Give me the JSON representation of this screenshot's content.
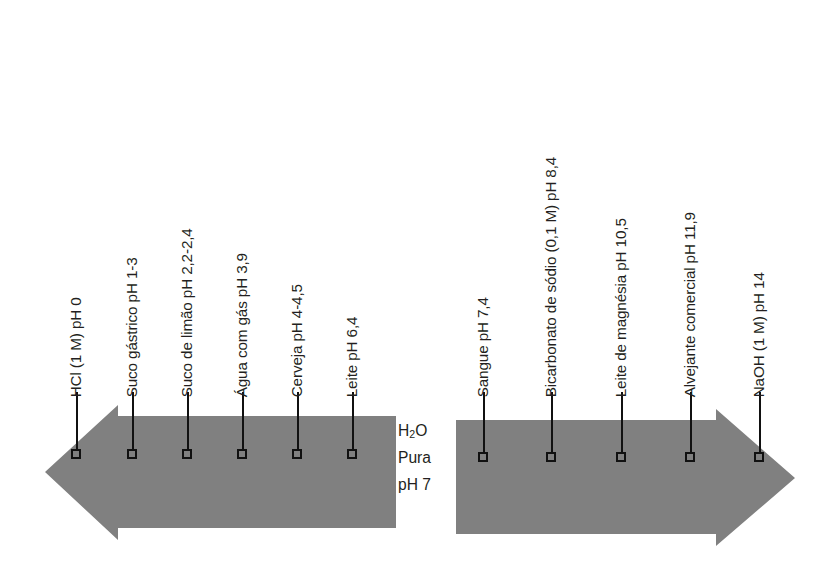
{
  "figure": {
    "arrow_color": "#808080",
    "line_color": "#111111",
    "text_color": "#231f20"
  },
  "center": {
    "line1_pre": "H",
    "line1_sub": "2",
    "line1_post": "O",
    "line2": "Pura",
    "line3": "pH 7"
  },
  "chart_data": {
    "type": "scatter",
    "xlabel": "pH",
    "ylabel": "",
    "xlim": [
      0,
      14
    ],
    "grid": false,
    "legend": "none",
    "categories": [
      "HCl (1 M)",
      "Suco gástrico",
      "Suco de limão",
      "Água com gás",
      "Cerveja",
      "Leite",
      "H2O Pura",
      "Sangue",
      "Bicarbonato de sódio (0,1 M)",
      "Leite de magnésia",
      "Alvejante comercial",
      "NaOH (1 M)"
    ],
    "values": [
      0,
      2,
      2.3,
      3.9,
      4.25,
      6.4,
      7,
      7.4,
      8.4,
      10.5,
      11.9,
      14
    ]
  },
  "left_labels": [
    {
      "text": "HCl (1 M) pH 0",
      "x": 77,
      "bottom": 382,
      "line_top": 392,
      "marker_y": 449
    },
    {
      "text": "Suco gástrico pH 1-3",
      "x": 133,
      "bottom": 382,
      "line_top": 392,
      "marker_y": 449
    },
    {
      "text": "Suco de limão pH 2,2-2,4",
      "x": 188,
      "bottom": 382,
      "line_top": 392,
      "marker_y": 449
    },
    {
      "text": "Água com gás pH 3,9",
      "x": 243,
      "bottom": 382,
      "line_top": 392,
      "marker_y": 449
    },
    {
      "text": "Cerveja pH 4-4,5",
      "x": 298,
      "bottom": 382,
      "line_top": 392,
      "marker_y": 449
    },
    {
      "text": "Leite pH 6,4",
      "x": 353,
      "bottom": 382,
      "line_top": 392,
      "marker_y": 449
    }
  ],
  "right_labels": [
    {
      "text": "Sangue pH 7,4",
      "x": 484,
      "bottom": 382,
      "line_top": 392,
      "marker_y": 452
    },
    {
      "text": "Bicarbonato de sódio (0,1 M) pH 8,4",
      "x": 552,
      "bottom": 382,
      "line_top": 392,
      "marker_y": 452
    },
    {
      "text": "Leite de magnésia pH 10,5",
      "x": 622,
      "bottom": 382,
      "line_top": 392,
      "marker_y": 452
    },
    {
      "text": "Alvejante comercial pH 11,9",
      "x": 691,
      "bottom": 382,
      "line_top": 392,
      "marker_y": 452
    },
    {
      "text": "NaOH (1 M) pH 14",
      "x": 760,
      "bottom": 382,
      "line_top": 392,
      "marker_y": 452
    }
  ]
}
